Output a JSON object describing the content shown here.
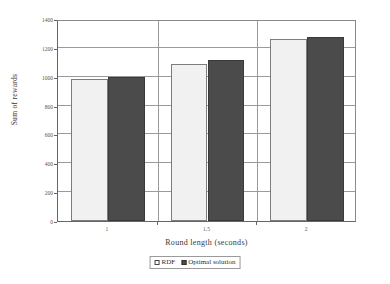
{
  "chart_data": {
    "type": "bar",
    "title": "",
    "xlabel": "Round length (seconds)",
    "ylabel": "Sum of rewards",
    "categories": [
      "1",
      "1.5",
      "2"
    ],
    "series": [
      {
        "name": "RDF",
        "values": [
          985,
          1090,
          1262
        ],
        "color": "#f1f1f1"
      },
      {
        "name": "Optimal solution",
        "values": [
          1000,
          1115,
          1272
        ],
        "color": "#4b4b4b"
      }
    ],
    "ylim": [
      0,
      1400
    ],
    "yticks": [
      0,
      200,
      400,
      600,
      800,
      1000,
      1200,
      1400
    ],
    "ytick_labels": [
      "0",
      "200",
      "400",
      "600",
      "800",
      "1000",
      "1200",
      "1400"
    ],
    "grid": "horizontal-and-category-dividers",
    "legend_position": "bottom-center",
    "legend_entries": [
      "RDF",
      "Optimal solution"
    ]
  },
  "axes": {
    "y_title": "Sum of rewards",
    "x_title": "Round length (seconds)"
  },
  "legend": {
    "items": [
      {
        "label": "RDF",
        "swatch": "light-square-swatch"
      },
      {
        "label": "Optimal solution",
        "swatch": "dark-square-swatch"
      }
    ]
  }
}
